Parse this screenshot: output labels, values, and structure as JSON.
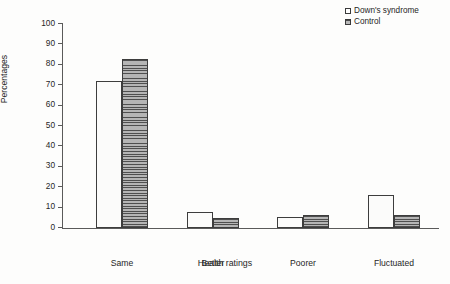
{
  "chart_data": {
    "type": "bar",
    "title": "",
    "xlabel": "Health ratings",
    "ylabel": "Percentages",
    "categories": [
      "Same",
      "Better",
      "Poorer",
      "Fluctuated"
    ],
    "series": [
      {
        "name": "Down's syndrome",
        "values": [
          72,
          8,
          5.5,
          16
        ],
        "marker": "open-square"
      },
      {
        "name": "Control",
        "values": [
          83,
          5,
          6.5,
          6.5
        ],
        "marker": "hatched-square"
      }
    ],
    "ylim": [
      0,
      100
    ],
    "yticks": [
      0,
      10,
      20,
      30,
      40,
      50,
      60,
      70,
      80,
      90,
      100
    ],
    "ytick_labels": [
      "0",
      "10",
      "20",
      "30",
      "40",
      "50",
      "60",
      "70",
      "80",
      "90",
      "100"
    ],
    "grid": false,
    "legend_position": "top-right"
  },
  "legend": {
    "items": [
      {
        "label": "Down's syndrome",
        "swatch": "open-square-icon"
      },
      {
        "label": "Control",
        "swatch": "hatched-square-icon"
      }
    ]
  },
  "axes": {
    "y_title": "Percentages",
    "x_title": "Health ratings"
  }
}
